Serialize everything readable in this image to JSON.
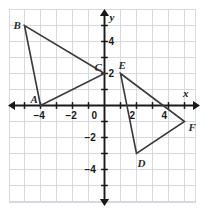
{
  "figure": {
    "background_color": "#ffffff",
    "grid_color": "#d8d8e0",
    "axis_color": "#1a1a1a",
    "shape_color": "#3a3a3a"
  },
  "axes": {
    "x_axis_label": "x",
    "y_axis_label": "y",
    "origin_label": "0",
    "x_range": [
      -6,
      6
    ],
    "y_range": [
      -6,
      6
    ],
    "grid": true,
    "x_ticks": [
      {
        "value": -4,
        "label": "−4"
      },
      {
        "value": -2,
        "label": "−2"
      },
      {
        "value": 2,
        "label": "2"
      },
      {
        "value": 4,
        "label": "4"
      }
    ],
    "y_ticks": [
      {
        "value": 4,
        "label": "4"
      },
      {
        "value": 2,
        "label": "2"
      },
      {
        "value": -2,
        "label": "−2"
      },
      {
        "value": -4,
        "label": "−4"
      }
    ]
  },
  "chart_data": {
    "type": "scatter",
    "xlabel": "x",
    "ylabel": "y",
    "xlim": [
      -6,
      6
    ],
    "ylim": [
      -6,
      6
    ],
    "grid": true,
    "shapes": [
      {
        "name": "triangle-abc",
        "vertices": [
          {
            "label": "A",
            "x": -4,
            "y": 0,
            "label_dx": -10,
            "label_dy": -12
          },
          {
            "label": "B",
            "x": -5,
            "y": 5,
            "label_dx": -11,
            "label_dy": -6
          },
          {
            "label": "C",
            "x": 0,
            "y": 2,
            "label_dx": -10,
            "label_dy": -12
          }
        ]
      },
      {
        "name": "triangle-def",
        "vertices": [
          {
            "label": "D",
            "x": 2,
            "y": -3,
            "label_dx": 1,
            "label_dy": 4
          },
          {
            "label": "E",
            "x": 1,
            "y": 2,
            "label_dx": -2,
            "label_dy": -14
          },
          {
            "label": "F",
            "x": 5,
            "y": -1,
            "label_dx": 4,
            "label_dy": 0
          }
        ]
      }
    ]
  }
}
